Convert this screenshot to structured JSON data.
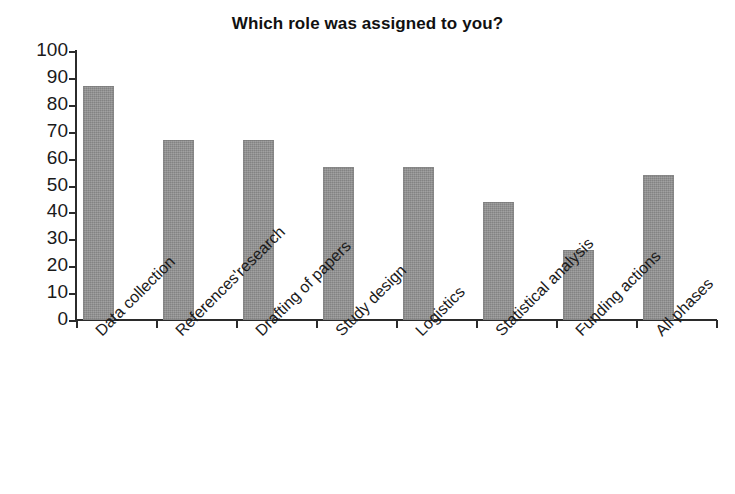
{
  "chart_data": {
    "type": "bar",
    "title": "Which role was assigned to you?",
    "xlabel": "",
    "ylabel": "",
    "ylim": [
      0,
      100
    ],
    "ytick_step": 10,
    "grid": false,
    "legend": "none",
    "bar_color": "#8c8c8c",
    "axis_color": "#2b2b2b",
    "categories": [
      "Data collection",
      "References'research",
      "Drafting of papers",
      "Study design",
      "Logistics",
      "Statistical analysis",
      "Funding actions",
      "All phases"
    ],
    "values": [
      87,
      67,
      67,
      57,
      57,
      44,
      26,
      54
    ],
    "ytick_labels": [
      "100",
      "90",
      "80",
      "70",
      "60",
      "50",
      "40",
      "30",
      "20",
      "10",
      "0"
    ]
  }
}
